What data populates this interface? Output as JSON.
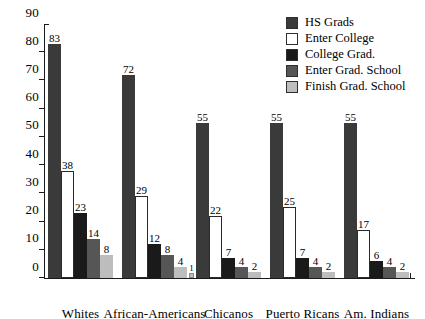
{
  "chart_data": {
    "type": "bar",
    "title": "",
    "subtitle": "",
    "xlabel": "",
    "ylabel": "",
    "ylim": [
      0,
      90
    ],
    "ytick_step": 10,
    "yticks": [
      0,
      10,
      20,
      30,
      40,
      50,
      60,
      70,
      80,
      90
    ],
    "grid": false,
    "legend_position": "top-right",
    "categories": [
      "Whites",
      "African-Americans",
      "Chicanos",
      "Puerto Ricans",
      "Am. Indians"
    ],
    "series": [
      {
        "name": "HS Grads",
        "color": "#3a3a3a",
        "values": [
          83,
          72,
          55,
          55,
          55
        ]
      },
      {
        "name": "Enter College",
        "color": "#ffffff",
        "values": [
          38,
          29,
          22,
          25,
          17
        ]
      },
      {
        "name": "College Grad.",
        "color": "#1a1a1a",
        "values": [
          23,
          12,
          7,
          7,
          6
        ]
      },
      {
        "name": "Enter Grad. School",
        "color": "#565656",
        "values": [
          14,
          8,
          4,
          4,
          4
        ]
      },
      {
        "name": "Finish Grad. School",
        "color": "#bdbdbd",
        "values": [
          8,
          4,
          2,
          2,
          2
        ]
      }
    ],
    "annotations": [
      {
        "text": "1",
        "series": "Finish Grad. School",
        "category": "African-Americans",
        "note": "small value marker at baseline"
      }
    ]
  },
  "legend": {
    "items": [
      {
        "label": "HS Grads",
        "color": "#3a3a3a"
      },
      {
        "label": "Enter College",
        "color": "#ffffff"
      },
      {
        "label": "College Grad.",
        "color": "#1a1a1a"
      },
      {
        "label": "Enter Grad. School",
        "color": "#565656"
      },
      {
        "label": "Finish Grad. School",
        "color": "#bdbdbd"
      }
    ]
  }
}
